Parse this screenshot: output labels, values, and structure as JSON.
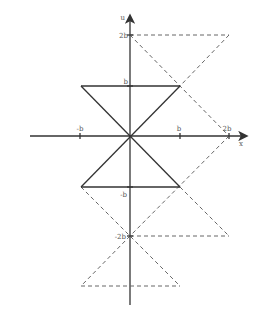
{
  "diagram": {
    "axes": {
      "x_label": "x",
      "y_label": "u"
    },
    "x_ticks": [
      {
        "label": "-b",
        "value": -1
      },
      {
        "label": "b",
        "value": 1
      },
      {
        "label": "2b",
        "value": 2
      }
    ],
    "y_ticks": [
      {
        "label": "2b",
        "value": 2
      },
      {
        "label": "b",
        "value": 1
      },
      {
        "label": "-b",
        "value": -1
      },
      {
        "label": "-2b",
        "value": -2
      }
    ],
    "solid_shapes": [
      {
        "name": "upper-triangle",
        "points": [
          [
            -1,
            1
          ],
          [
            1,
            1
          ],
          [
            0,
            0
          ]
        ]
      },
      {
        "name": "lower-triangle",
        "points": [
          [
            -1,
            -1
          ],
          [
            1,
            -1
          ],
          [
            0,
            0
          ]
        ]
      }
    ],
    "dashed_shapes": [
      {
        "name": "upper-dashed-triangle",
        "points": [
          [
            0,
            2
          ],
          [
            2,
            2
          ],
          [
            1,
            1
          ]
        ]
      },
      {
        "name": "upper-right-dashed-triangle",
        "points": [
          [
            0,
            2
          ],
          [
            2,
            0
          ],
          [
            1,
            1
          ]
        ]
      },
      {
        "name": "lower-right-dashed-triangle",
        "points": [
          [
            2,
            0
          ],
          [
            0,
            -2
          ],
          [
            2,
            -2
          ]
        ]
      },
      {
        "name": "lower-left-dashed-triangle",
        "points": [
          [
            -1,
            -1
          ],
          [
            1,
            -3
          ],
          [
            -1,
            -3
          ]
        ]
      }
    ]
  }
}
